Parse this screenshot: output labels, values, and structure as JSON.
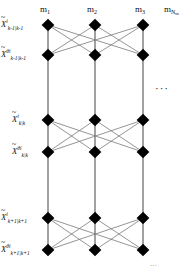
{
  "figure": {
    "type": "trellis-lattice-diagram",
    "width": 191,
    "height": 270,
    "node_color": "#000000",
    "vertical_edge_color": "#8a8a8a",
    "diagonal_edge_color": "#7a7a7a",
    "background": "#ffffff"
  },
  "columns": {
    "headers": [
      {
        "id": "m1",
        "base": "m",
        "sub": "1",
        "subsub": "",
        "x": 48
      },
      {
        "id": "m2",
        "base": "m",
        "sub": "2",
        "subsub": "",
        "x": 95
      },
      {
        "id": "m3",
        "base": "m",
        "sub": "3",
        "subsub": "",
        "x": 143
      },
      {
        "id": "mNm",
        "base": "m",
        "sub": "N",
        "subsub": "m",
        "x": 172
      }
    ]
  },
  "rows": [
    {
      "id": "row-k-1-prior",
      "base": "X",
      "tilde": "~",
      "sup": "i",
      "sub": "k-1|k-1",
      "y": 25
    },
    {
      "id": "row-k-1-theta",
      "base": "X",
      "tilde": "~",
      "sup": "θi",
      "sub": "k-1|k-1",
      "y": 55
    },
    {
      "id": "row-k-prior",
      "base": "X",
      "tilde": "~",
      "sup": "i",
      "sub": "k|k",
      "y": 120
    },
    {
      "id": "row-k-theta",
      "base": "X",
      "tilde": "~",
      "sup": "θi",
      "sub": "k|k",
      "y": 152
    },
    {
      "id": "row-k+1-prior",
      "base": "X",
      "tilde": "~",
      "sup": "i",
      "sub": "k+1|k+1",
      "y": 218
    },
    {
      "id": "row-k+1-theta",
      "base": "X",
      "tilde": "~",
      "sup": "θi",
      "sub": "k+1|k+1",
      "y": 250
    }
  ],
  "ellipsis": {
    "horizontal": "···",
    "x": 155,
    "y": 83
  },
  "bottom_caption": {
    "text": "···"
  }
}
